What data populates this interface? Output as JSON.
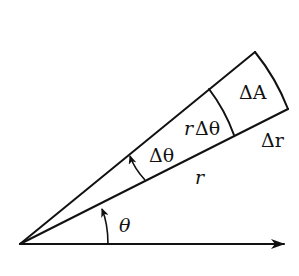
{
  "diagram": {
    "type": "polar-area-element",
    "colors": {
      "stroke": "#111111",
      "background": "#ffffff"
    },
    "labels": {
      "delta_a": "ΔA",
      "r_delta_theta_r": "r",
      "r_delta_theta_dt": "Δθ",
      "delta_theta": "Δθ",
      "delta_r": "Δr",
      "r": "r",
      "theta": "θ"
    },
    "geometry": {
      "origin": [
        20,
        244
      ],
      "axis_end": [
        284,
        244
      ],
      "upper_ray_end": [
        255,
        52
      ],
      "lower_ray_end": [
        288,
        109
      ],
      "inner_arc": [
        [
          209,
          89
        ],
        [
          234,
          135
        ]
      ],
      "delta_theta_arc": [
        [
          128,
          154
        ],
        [
          145,
          180
        ]
      ],
      "theta_arc": [
        [
          102,
          207
        ],
        [
          108,
          244
        ]
      ]
    }
  }
}
